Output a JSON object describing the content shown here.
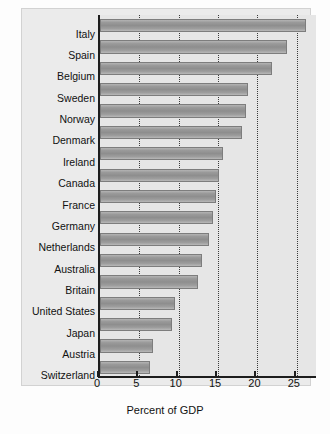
{
  "chart_data": {
    "type": "bar",
    "orientation": "horizontal",
    "title": "",
    "subtitle": "",
    "xlabel": "Percent of GDP",
    "ylabel": "",
    "xlim": [
      0,
      27.7
    ],
    "xticks": [
      0,
      5,
      10,
      15,
      20,
      25
    ],
    "xtick_labels": [
      "0",
      "5",
      "10",
      "15",
      "20",
      "25"
    ],
    "grid": "vertical dotted gridlines at each x tick",
    "legend": "none",
    "categories": [
      "Italy",
      "Spain",
      "Belgium",
      "Sweden",
      "Norway",
      "Denmark",
      "Ireland",
      "Canada",
      "France",
      "Germany",
      "Netherlands",
      "Australia",
      "Britain",
      "United States",
      "Japan",
      "Austria",
      "Switzerland"
    ],
    "values": [
      26.2,
      23.8,
      21.8,
      18.8,
      18.5,
      18.0,
      15.6,
      15.1,
      14.7,
      14.3,
      13.9,
      13.0,
      12.4,
      9.5,
      9.1,
      6.7,
      6.3
    ],
    "bar_color": "#979797",
    "axis_color": "#1d1d1d",
    "panel_color": "#e6e6e6"
  },
  "axis": {
    "title": "Percent of GDP"
  }
}
